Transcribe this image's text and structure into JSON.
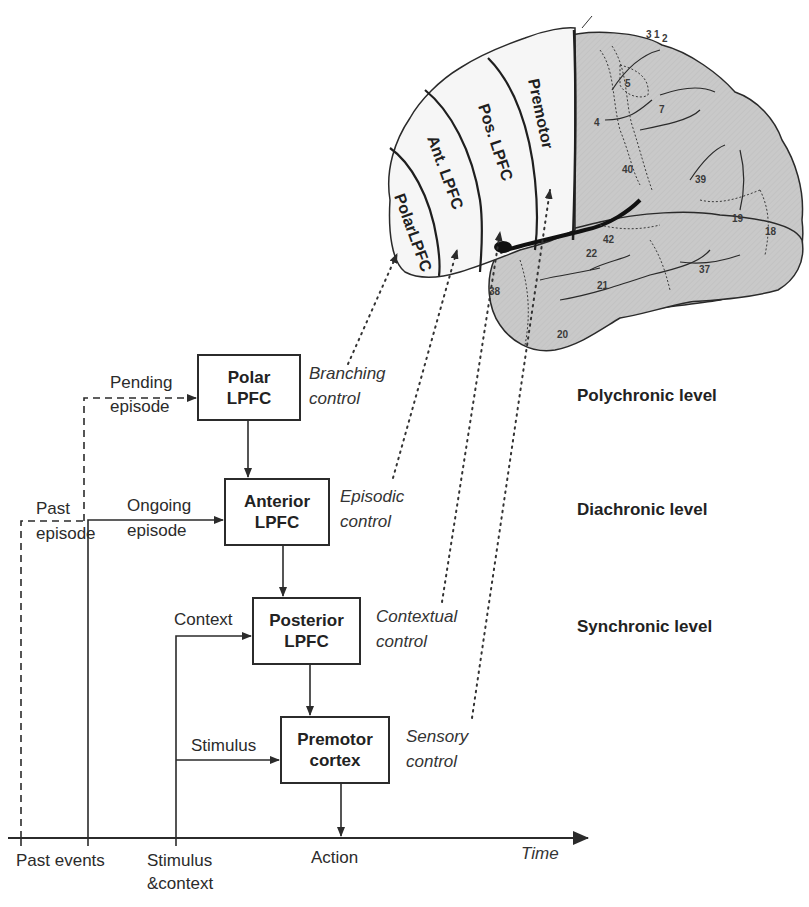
{
  "figure": {
    "brain": {
      "regions": [
        {
          "id": "polar",
          "label": "PolarLPFC"
        },
        {
          "id": "anterior",
          "label": "Ant. LPFC"
        },
        {
          "id": "posterior",
          "label": "Pos. LPFC"
        },
        {
          "id": "premotor",
          "label": "Premotor"
        }
      ],
      "area_numbers": [
        "3",
        "1",
        "2",
        "4",
        "5",
        "7",
        "40",
        "39",
        "19",
        "18",
        "42",
        "22",
        "21",
        "37",
        "38",
        "20"
      ],
      "colors": {
        "frontal": "#f4f4f4",
        "posterior_cortex": "#c8c8c8",
        "outline": "#2a2a2a"
      }
    },
    "boxes": {
      "polar": {
        "line1": "Polar",
        "line2": "LPFC"
      },
      "anterior": {
        "line1": "Anterior",
        "line2": "LPFC"
      },
      "posterior": {
        "line1": "Posterior",
        "line2": "LPFC"
      },
      "premotor": {
        "line1": "Premotor",
        "line2": "cortex"
      }
    },
    "controls": {
      "branching": {
        "line1": "Branching",
        "line2": "control"
      },
      "episodic": {
        "line1": "Episodic",
        "line2": "control"
      },
      "contextual": {
        "line1": "Contextual",
        "line2": "control"
      },
      "sensory": {
        "line1": "Sensory",
        "line2": "control"
      }
    },
    "inputs": {
      "pending": {
        "line1": "Pending",
        "line2": "episode"
      },
      "past": {
        "line1": "Past",
        "line2": "episode"
      },
      "ongoing": {
        "line1": "Ongoing",
        "line2": "episode"
      },
      "context": "Context",
      "stimulus": "Stimulus"
    },
    "levels": {
      "polychronic": "Polychronic level",
      "diachronic": "Diachronic level",
      "synchronic": "Synchronic level"
    },
    "time_axis": {
      "label": "Time",
      "ticks": [
        {
          "label": "Past events"
        },
        {
          "label_line1": "Stimulus",
          "label_line2": "&context"
        },
        {
          "label": "Action"
        }
      ]
    }
  }
}
